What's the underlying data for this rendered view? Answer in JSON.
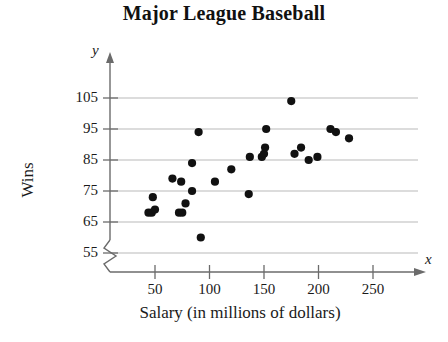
{
  "chart_data": {
    "type": "scatter",
    "title": "Major League Baseball",
    "xlabel": "Salary (in millions of dollars)",
    "ylabel": "Wins",
    "x_axis_variable": "x",
    "y_axis_variable": "y",
    "grid": true,
    "y_axis_break": true,
    "xlim": [
      20,
      270
    ],
    "ylim": [
      55,
      108
    ],
    "xticks": [
      50,
      100,
      150,
      200,
      250
    ],
    "yticks": [
      55,
      65,
      75,
      85,
      95,
      105
    ],
    "xtick_labels": [
      "50",
      "100",
      "150",
      "200",
      "250"
    ],
    "ytick_labels": [
      "55",
      "65",
      "75",
      "85",
      "95",
      "105"
    ],
    "points": [
      {
        "x": 48,
        "y": 73
      },
      {
        "x": 44,
        "y": 68
      },
      {
        "x": 47,
        "y": 68
      },
      {
        "x": 50,
        "y": 69
      },
      {
        "x": 66,
        "y": 79
      },
      {
        "x": 72,
        "y": 68
      },
      {
        "x": 75,
        "y": 68
      },
      {
        "x": 74,
        "y": 78
      },
      {
        "x": 78,
        "y": 71
      },
      {
        "x": 84,
        "y": 75
      },
      {
        "x": 84,
        "y": 84
      },
      {
        "x": 90,
        "y": 94
      },
      {
        "x": 92,
        "y": 60
      },
      {
        "x": 105,
        "y": 78
      },
      {
        "x": 120,
        "y": 82
      },
      {
        "x": 136,
        "y": 74
      },
      {
        "x": 137,
        "y": 86
      },
      {
        "x": 148,
        "y": 86
      },
      {
        "x": 150,
        "y": 87
      },
      {
        "x": 151,
        "y": 89
      },
      {
        "x": 152,
        "y": 95
      },
      {
        "x": 175,
        "y": 104
      },
      {
        "x": 178,
        "y": 87
      },
      {
        "x": 184,
        "y": 89
      },
      {
        "x": 191,
        "y": 85
      },
      {
        "x": 199,
        "y": 86
      },
      {
        "x": 211,
        "y": 95
      },
      {
        "x": 216,
        "y": 94
      },
      {
        "x": 228,
        "y": 92
      }
    ]
  }
}
